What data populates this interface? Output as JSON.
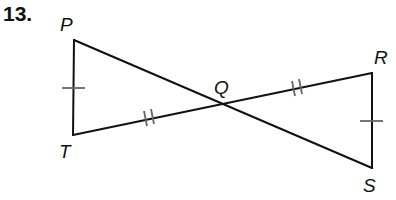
{
  "problem": {
    "number": "13."
  },
  "figure": {
    "type": "two triangles sharing vertex Q (bowtie)",
    "stroke_color": "#111111",
    "tick_color": "#666666",
    "points": {
      "P": {
        "label": "P",
        "x": 74,
        "y": 40
      },
      "T": {
        "label": "T",
        "x": 73,
        "y": 135
      },
      "Q": {
        "label": "Q",
        "x": 222,
        "y": 104
      },
      "R": {
        "label": "R",
        "x": 372,
        "y": 73
      },
      "S": {
        "label": "S",
        "x": 372,
        "y": 168
      }
    },
    "segments": [
      "PT",
      "PS",
      "TR",
      "RS"
    ],
    "congruence_marks": [
      {
        "segments": [
          "PT",
          "RS"
        ],
        "ticks": 1
      },
      {
        "segments": [
          "TQ",
          "QR"
        ],
        "ticks": 2
      }
    ]
  }
}
